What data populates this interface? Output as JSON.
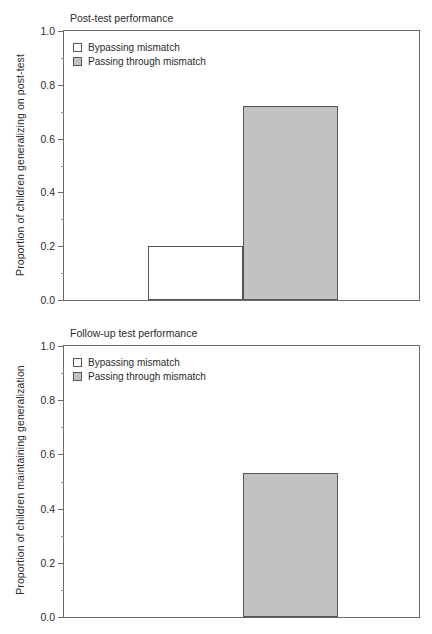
{
  "chart_data": [
    {
      "type": "bar",
      "title": "Post-test performance",
      "xlabel": "",
      "ylabel": "Proportion of children generalizing on post-test",
      "ylim": [
        0.0,
        1.0
      ],
      "grid": false,
      "legend_position": "top-left",
      "categories": [
        "Bypassing mismatch",
        "Passing through mismatch"
      ],
      "values": [
        0.2,
        0.72
      ],
      "ticks": [
        "0.0",
        "0.2",
        "0.4",
        "0.6",
        "0.8",
        "1.0"
      ],
      "tick_values": [
        0.0,
        0.2,
        0.4,
        0.6,
        0.8,
        1.0
      ],
      "minor_tick_values": [
        0.1,
        0.3,
        0.5,
        0.7,
        0.9
      ],
      "legend": [
        {
          "label": "Bypassing mismatch",
          "style": "open",
          "color": "#ffffff"
        },
        {
          "label": "Passing through mismatch",
          "style": "filled",
          "color": "#c2c2c2"
        }
      ]
    },
    {
      "type": "bar",
      "title": "Follow-up test performance",
      "xlabel": "",
      "ylabel": "Proportion of children maintaining generalization",
      "ylim": [
        0.0,
        1.0
      ],
      "grid": false,
      "legend_position": "top-left",
      "categories": [
        "Bypassing mismatch",
        "Passing through mismatch"
      ],
      "values": [
        0.0,
        0.53
      ],
      "ticks": [
        "0.0",
        "0.2",
        "0.4",
        "0.6",
        "0.8",
        "1.0"
      ],
      "tick_values": [
        0.0,
        0.2,
        0.4,
        0.6,
        0.8,
        1.0
      ],
      "minor_tick_values": [
        0.1,
        0.3,
        0.5,
        0.7,
        0.9
      ],
      "legend": [
        {
          "label": "Bypassing mismatch",
          "style": "open",
          "color": "#ffffff"
        },
        {
          "label": "Passing through mismatch",
          "style": "filled",
          "color": "#c2c2c2"
        }
      ]
    }
  ],
  "style": {
    "axis_color": "#6a6a6a",
    "bar_edge_color": "#555555",
    "fill_gray": "#c2c2c2",
    "fill_white": "#ffffff",
    "text_color": "#2b2b2b",
    "background": "#ffffff"
  }
}
